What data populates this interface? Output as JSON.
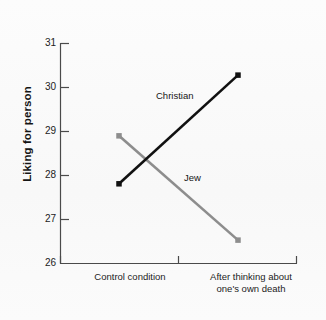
{
  "chart_data": {
    "type": "line",
    "title": "",
    "subtitle": "",
    "xlabel": "",
    "ylabel": "Liking for person",
    "categories": [
      "Control condition",
      "After thinking about one's own death"
    ],
    "category_lines": [
      [
        "Control condition"
      ],
      [
        "After thinking about",
        "one's own death"
      ]
    ],
    "ylim": [
      26,
      31
    ],
    "yticks": [
      26,
      27,
      28,
      29,
      30,
      31
    ],
    "ytick_labels": [
      "26",
      "27",
      "28",
      "29",
      "30",
      "31"
    ],
    "grid": false,
    "legend_position": "inline-annotation",
    "series": [
      {
        "name": "Christian",
        "color": "#111111",
        "marker": "square",
        "values": [
          27.8,
          30.27
        ],
        "label_text": "Christian"
      },
      {
        "name": "Jew",
        "color": "#8d8d8d",
        "marker": "square",
        "values": [
          28.89,
          26.52
        ],
        "label_text": "Jew"
      }
    ],
    "annotations": [
      {
        "text": "Christian",
        "series": "Christian"
      },
      {
        "text": "Jew",
        "series": "Jew"
      }
    ]
  },
  "axis": {
    "y_title": "Liking for person",
    "tick_26": "26",
    "tick_27": "27",
    "tick_28": "28",
    "tick_29": "29",
    "tick_30": "30",
    "tick_31": "31",
    "x_label_left": "Control condition",
    "x_label_right_line1": "After thinking about",
    "x_label_right_line2": "one's own death"
  },
  "labels": {
    "christian": "Christian",
    "jew": "Jew"
  },
  "colors": {
    "christian_line": "#111111",
    "jew_line": "#8d8d8d",
    "axis": "#4a4a4a",
    "background": "#fbfbfb"
  }
}
